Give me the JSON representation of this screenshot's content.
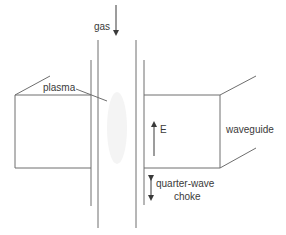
{
  "diagram": {
    "labels": {
      "gas": "gas",
      "plasma": "plasma",
      "e_field": "E",
      "waveguide": "waveguide",
      "choke_line1": "quarter-wave",
      "choke_line2": "choke"
    },
    "colors": {
      "line": "#6e6e6e",
      "text": "#3a3a3a",
      "plasma_glow": "#f2f2f2",
      "background": "#ffffff"
    }
  }
}
